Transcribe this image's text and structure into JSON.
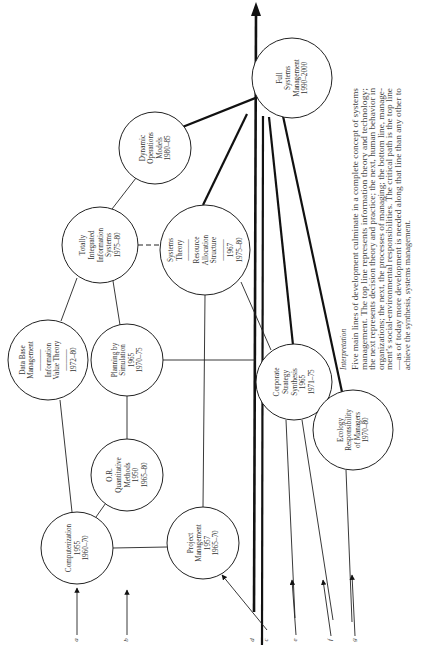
{
  "diagram": {
    "orientation": "rotated-90-ccw",
    "nodes": [
      {
        "id": "full-systems-management",
        "lines": [
          "Full",
          "Systems",
          "Management",
          "1990–2000"
        ]
      },
      {
        "id": "dynamic-operations-models",
        "lines": [
          "Dynamic",
          "Operations",
          "Models",
          "1980–85"
        ]
      },
      {
        "id": "totally-integrated-information-systems",
        "lines": [
          "Totally",
          "Integrated",
          "Information",
          "Systems",
          "1975–80"
        ]
      },
      {
        "id": "systems-theory-resource-allocation",
        "lines": [
          "Systems",
          "Theory",
          "———",
          "Resource",
          "Allocation",
          "Structure",
          "———",
          "1967",
          "1975–80"
        ]
      },
      {
        "id": "data-base-management",
        "lines": [
          "Data Base",
          "Management",
          "———",
          "Information",
          "Value Theory",
          "———",
          "1972–80"
        ]
      },
      {
        "id": "planning-by-simulation",
        "lines": [
          "Planning by",
          "Simulation",
          "1965",
          "1970–75"
        ]
      },
      {
        "id": "corporate-strategy-synthesis",
        "lines": [
          "Corporate",
          "Strategy",
          "Synthesis",
          "1965",
          "1971–75"
        ]
      },
      {
        "id": "or-quantitative-methods",
        "lines": [
          "O.R.",
          "Quantitative",
          "Methods",
          "1950",
          "1965–80"
        ]
      },
      {
        "id": "ecology-responsibility",
        "lines": [
          "Ecology",
          "Responsibility",
          "of Managers",
          "1970–80"
        ]
      },
      {
        "id": "computerization",
        "lines": [
          "Computerization",
          "1955",
          "1960–70"
        ]
      },
      {
        "id": "project-management",
        "lines": [
          "Project",
          "Management",
          "1957",
          "1965–70"
        ]
      }
    ],
    "input_labels": [
      "a",
      "b",
      "d",
      "c",
      "e",
      "f",
      "g"
    ],
    "interpretation": {
      "title": "Interpretation",
      "lines": [
        "Five main lines of development culminate in a complete concept of systems",
        "management. The top line represents information theory and technology;",
        "the next represents decision theory and practice; the next, human behavior in",
        "organizations; the next, the processes of managing; the bottom line, manage-",
        "ment’s social-environmental responsibilities. The critical path is the top line",
        "—as of today more development is needed along that line than any other to",
        "achieve the synthesis, systems management."
      ]
    }
  }
}
